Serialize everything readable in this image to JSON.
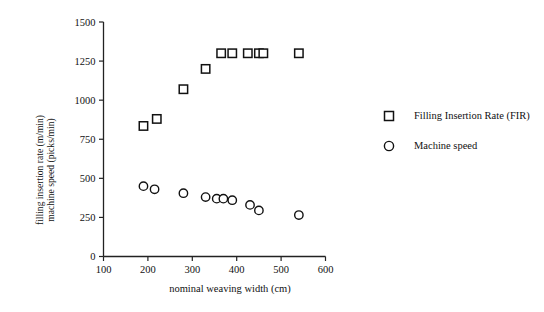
{
  "chart_data": {
    "type": "scatter",
    "title": "",
    "xlabel": "nominal weaving width (cm)",
    "ylabel_line1": "filling insertion rate (m/min)",
    "ylabel_line2": "machine speed  (picks/min)",
    "xlim": [
      100,
      600
    ],
    "ylim": [
      0,
      1500
    ],
    "xticks": [
      100,
      200,
      300,
      400,
      500,
      600
    ],
    "yticks": [
      0,
      250,
      500,
      750,
      1000,
      1250,
      1500
    ],
    "xtick_labels": [
      "100",
      "200",
      "300",
      "400",
      "500",
      "600"
    ],
    "ytick_labels": [
      "0",
      "250",
      "500",
      "750",
      "1000",
      "1250",
      "1500"
    ],
    "grid": false,
    "legend_position": "right",
    "series": [
      {
        "name": "Filling Insertion Rate (FIR)",
        "marker": "square",
        "x": [
          190,
          220,
          280,
          330,
          365,
          390,
          425,
          450,
          460,
          540
        ],
        "y": [
          835,
          880,
          1070,
          1200,
          1300,
          1300,
          1300,
          1300,
          1300,
          1300
        ]
      },
      {
        "name": "Machine speed",
        "marker": "circle",
        "x": [
          190,
          215,
          280,
          330,
          355,
          370,
          390,
          430,
          450,
          540
        ],
        "y": [
          450,
          430,
          405,
          380,
          370,
          370,
          360,
          330,
          295,
          265
        ]
      }
    ]
  },
  "legend": {
    "items": [
      {
        "label": "Filling Insertion Rate (FIR)",
        "marker": "square"
      },
      {
        "label": "Machine speed",
        "marker": "circle"
      }
    ]
  }
}
